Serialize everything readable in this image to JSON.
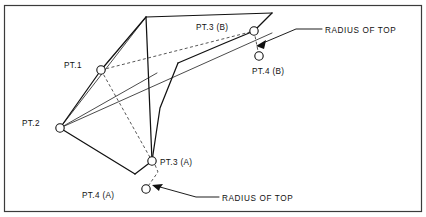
{
  "diagram": {
    "frame": {
      "x": 4,
      "y": 5,
      "width": 418,
      "height": 207
    },
    "colors": {
      "background": "#ffffff",
      "frame_stroke": "#3b3b3b",
      "solid_stroke": "#111111",
      "thin_stroke": "#2a2a2a",
      "dashed_stroke": "#444444",
      "node_fill": "#ffffff"
    },
    "nodes": [
      {
        "id": "pt1",
        "label": "PT.1",
        "cx": 101,
        "cy": 70,
        "r": 4.2,
        "label_x": 64,
        "label_y": 68,
        "label_anchor": "start"
      },
      {
        "id": "pt2",
        "label": "PT.2",
        "cx": 60,
        "cy": 128,
        "r": 4.2,
        "label_x": 22,
        "label_y": 126,
        "label_anchor": "start"
      },
      {
        "id": "pt3a",
        "label": "PT.3 (A)",
        "cx": 152,
        "cy": 161,
        "r": 4.2,
        "label_x": 160,
        "label_y": 165,
        "label_anchor": "start"
      },
      {
        "id": "pt4a",
        "label": "PT.4 (A)",
        "cx": 146,
        "cy": 189,
        "r": 4.2,
        "label_x": 82,
        "label_y": 198,
        "label_anchor": "start"
      },
      {
        "id": "pt3b",
        "label": "PT.3 (B)",
        "cx": 254,
        "cy": 31,
        "r": 4.2,
        "label_x": 196,
        "label_y": 30,
        "label_anchor": "start"
      },
      {
        "id": "pt4b",
        "label": "PT.4 (B)",
        "cx": 259,
        "cy": 56,
        "r": 4.2,
        "label_x": 252,
        "label_y": 74,
        "label_anchor": "start"
      }
    ],
    "callouts": [
      {
        "id": "callout-top",
        "text": "RADIUS OF TOP",
        "text_x": 325,
        "text_y": 33,
        "leader": "M 322 29 L 296 29 L 262 44",
        "arrow": {
          "x": 258,
          "y": 46,
          "angle": 205
        }
      },
      {
        "id": "callout-bottom",
        "text": "RADIUS OF TOP",
        "text_x": 222,
        "text_y": 202,
        "leader": "M 219 198 L 196 198 L 156 188",
        "arrow": {
          "x": 152,
          "y": 187,
          "angle": 194
        }
      }
    ],
    "paths": {
      "solid_outline_upper": "M 101 70 L 146 17 L 272 13 L 254 31",
      "solid_outline_right": "M 254 31 L 225 43 L 179 62 L 157 73",
      "solid_spine": "M 146 17 L 152 161",
      "solid_outline_lower": "M 60 128 L 135 174 L 152 161",
      "solid_left_upper": "M 101 70 L 60 128",
      "thin_left_upper": "M 60 128 L 101 70",
      "thin_pt2_to_top": "M 60 128 L 272 33",
      "thin_pt2_to_apex": "M 60 128 L 146 17",
      "thin_pt1_side": "M 101 70 L 146 17"
    },
    "dashed_paths": {
      "pt1_to_pt3b": "M 101 70 L 254 31",
      "pt1_to_pt3a": "M 101 70 L 152 161",
      "pt3a_to_pt4a": "M 152 161 L 146 189",
      "pt3b_to_pt4b": "M 254 31 L 259 56"
    }
  }
}
